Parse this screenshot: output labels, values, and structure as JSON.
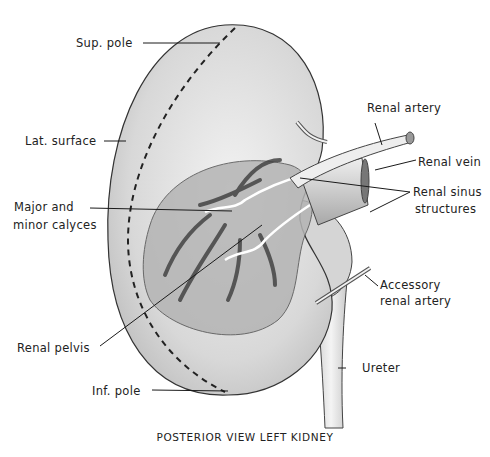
{
  "figure": {
    "title": "POSTERIOR VIEW LEFT KIDNEY",
    "labels": {
      "sup_pole": "Sup. pole",
      "lat_surface": "Lat. surface",
      "major_minor_calyces_line1": "Major and",
      "major_minor_calyces_line2": "minor calyces",
      "renal_pelvis": "Renal pelvis",
      "inf_pole": "Inf. pole",
      "renal_artery": "Renal artery",
      "renal_vein": "Renal vein",
      "renal_sinus_line1": "Renal sinus",
      "renal_sinus_line2": "structures",
      "accessory_line1": "Accessory",
      "accessory_line2": "renal artery",
      "ureter": "Ureter"
    },
    "colors": {
      "background": "#ffffff",
      "kidney_fill": "#dcdcdc",
      "sinus_fill": "#a9a9a9",
      "outline": "#333333",
      "leader_lines": "#1a1a1a"
    }
  }
}
